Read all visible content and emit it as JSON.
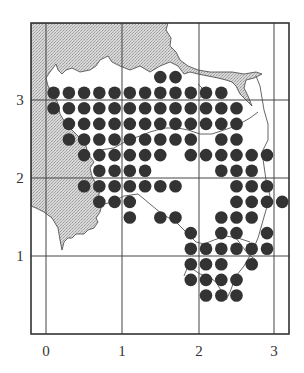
{
  "figure": {
    "type": "grid-dot-distribution-map",
    "x_axis": {
      "ticks": [
        "0",
        "1",
        "2",
        "3"
      ]
    },
    "y_axis": {
      "ticks": [
        "1",
        "2",
        "3"
      ]
    },
    "colors": {
      "dot": "#333333",
      "land_shading": "#cfcfcf",
      "grid": "#444444",
      "frame": "#333333",
      "coastline": "#444444"
    },
    "legend": null
  },
  "chart_data": {
    "type": "scatter",
    "title": "",
    "xlabel": "",
    "ylabel": "",
    "xlim": [
      -0.2,
      3.2
    ],
    "ylim": [
      -0.7,
      3.5
    ],
    "grid": true,
    "x_ticks": [
      0,
      1,
      2,
      3
    ],
    "y_ticks": [
      1,
      2,
      3
    ],
    "dot_spacing": 0.2,
    "rows": [
      {
        "y": 3.3,
        "x": [
          1.5,
          1.7
        ]
      },
      {
        "y": 3.1,
        "x": [
          0.1,
          0.3,
          0.5,
          0.7,
          0.9,
          1.1,
          1.3,
          1.5,
          1.7,
          1.9,
          2.1,
          2.3
        ]
      },
      {
        "y": 2.9,
        "x": [
          0.1,
          0.3,
          0.5,
          0.7,
          0.9,
          1.1,
          1.3,
          1.5,
          1.7,
          1.9,
          2.1,
          2.3,
          2.5
        ]
      },
      {
        "y": 2.7,
        "x": [
          0.3,
          0.5,
          0.7,
          0.9,
          1.1,
          1.3,
          1.5,
          1.7,
          1.9,
          2.1,
          2.3,
          2.5
        ]
      },
      {
        "y": 2.5,
        "x": [
          0.3,
          0.5,
          0.7,
          0.9,
          1.1,
          1.3,
          1.5,
          1.7,
          1.9,
          2.3,
          2.5
        ]
      },
      {
        "y": 2.3,
        "x": [
          0.5,
          0.7,
          0.9,
          1.1,
          1.3,
          1.5,
          1.9,
          2.1,
          2.3,
          2.5,
          2.7,
          2.9
        ]
      },
      {
        "y": 2.1,
        "x": [
          0.7,
          0.9,
          1.1,
          1.3,
          2.3,
          2.5,
          2.7
        ]
      },
      {
        "y": 1.9,
        "x": [
          0.5,
          0.7,
          0.9,
          1.1,
          1.3,
          1.5,
          1.7,
          2.5,
          2.7,
          2.9
        ]
      },
      {
        "y": 1.7,
        "x": [
          0.7,
          0.9,
          1.1,
          2.5,
          2.7,
          2.9,
          3.1
        ]
      },
      {
        "y": 1.5,
        "x": [
          1.1,
          1.5,
          1.7,
          2.3,
          2.5,
          2.7
        ]
      },
      {
        "y": 1.3,
        "x": [
          1.9,
          2.3,
          2.5,
          2.9
        ]
      },
      {
        "y": 1.1,
        "x": [
          1.9,
          2.1,
          2.3,
          2.5,
          2.7,
          2.9
        ]
      },
      {
        "y": 0.9,
        "x": [
          1.9,
          2.1,
          2.3,
          2.7
        ]
      },
      {
        "y": 0.7,
        "x": [
          1.9,
          2.1,
          2.3,
          2.5
        ]
      },
      {
        "y": 0.5,
        "x": [
          2.1,
          2.3,
          2.5
        ]
      }
    ],
    "total_points": 115
  }
}
